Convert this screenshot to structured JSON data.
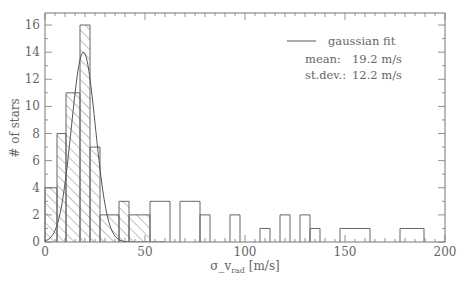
{
  "chart_data": {
    "type": "bar",
    "subtype": "histogram",
    "title": "",
    "xlabel": "σ_v_rad [m/s]",
    "xlabel_main": "σ_v",
    "xlabel_sub": "rad",
    "xlabel_unit": " [m/s]",
    "ylabel": "# of stars",
    "xlim": [
      0,
      200
    ],
    "ylim": [
      0,
      17
    ],
    "xticks": [
      0,
      50,
      100,
      150,
      200
    ],
    "yticks": [
      0,
      2,
      4,
      6,
      8,
      10,
      12,
      14,
      16
    ],
    "grid": false,
    "legend_position": "upper right",
    "bins": [
      {
        "x0": 0,
        "x1": 6,
        "count": 4
      },
      {
        "x0": 6,
        "x1": 10.5,
        "count": 8
      },
      {
        "x0": 10.5,
        "x1": 17.5,
        "count": 11
      },
      {
        "x0": 17.5,
        "x1": 22.5,
        "count": 16
      },
      {
        "x0": 22.5,
        "x1": 27.5,
        "count": 7
      },
      {
        "x0": 27.5,
        "x1": 37,
        "count": 2
      },
      {
        "x0": 37,
        "x1": 42,
        "count": 3
      },
      {
        "x0": 42,
        "x1": 52.5,
        "count": 2
      },
      {
        "x0": 52.5,
        "x1": 62.5,
        "count": 3
      },
      {
        "x0": 67.5,
        "x1": 77.5,
        "count": 3
      },
      {
        "x0": 77.5,
        "x1": 82.5,
        "count": 2
      },
      {
        "x0": 92.5,
        "x1": 97.5,
        "count": 2
      },
      {
        "x0": 107.5,
        "x1": 112.5,
        "count": 1
      },
      {
        "x0": 117.5,
        "x1": 122.5,
        "count": 2
      },
      {
        "x0": 127.5,
        "x1": 132.5,
        "count": 2
      },
      {
        "x0": 132.5,
        "x1": 137.5,
        "count": 1
      },
      {
        "x0": 147.5,
        "x1": 162.5,
        "count": 1
      },
      {
        "x0": 177.5,
        "x1": 189.5,
        "count": 1
      }
    ],
    "hatched_region": {
      "x0": 0,
      "x1": 52.5,
      "description": "hatched (diagonal lines) area under histogram for low-dispersion stars"
    },
    "series": [
      {
        "name": "gaussian fit",
        "type": "line",
        "amplitude": 14,
        "mean": 19.2,
        "sigma_curve": 6
      }
    ],
    "annotations": [
      {
        "text": "gaussian fit",
        "role": "legend"
      },
      {
        "label": "mean:",
        "value": "19.2 m/s"
      },
      {
        "label": "st.dev.:",
        "value": "12.2 m/s"
      }
    ]
  },
  "legend": {
    "fit_label": "gaussian fit",
    "mean_label": "mean:",
    "mean_value": "19.2 m/s",
    "sd_label": "st.dev.:",
    "sd_value": "12.2 m/s"
  }
}
